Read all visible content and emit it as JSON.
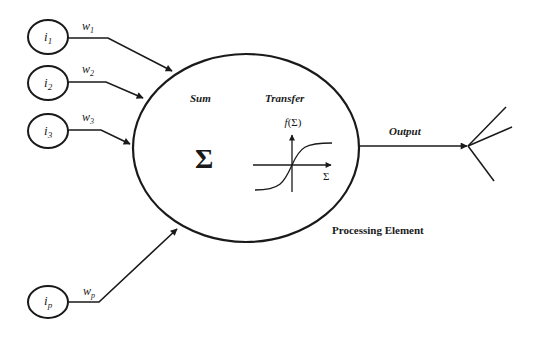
{
  "diagram": {
    "title": "Processing Element",
    "inputs": [
      {
        "name": "i",
        "sub": "1",
        "weight": "w",
        "weight_sub": "1"
      },
      {
        "name": "i",
        "sub": "2",
        "weight": "w",
        "weight_sub": "2"
      },
      {
        "name": "i",
        "sub": "3",
        "weight": "w",
        "weight_sub": "3"
      },
      {
        "name": "i",
        "sub": "p",
        "weight": "w",
        "weight_sub": "p"
      }
    ],
    "sum_label": "Sum",
    "sum_symbol": "Σ",
    "transfer_label": "Transfer",
    "transfer_fn_label": "f(Σ)",
    "transfer_axis_label": "Σ",
    "output_label": "Output",
    "processing_element_label": "Processing Element"
  },
  "colors": {
    "stroke": "#1a1a1a",
    "background": "#ffffff"
  }
}
